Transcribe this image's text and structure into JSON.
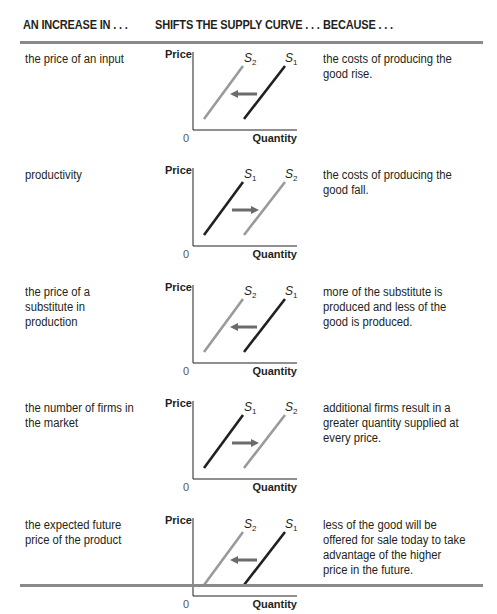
{
  "table": {
    "headers": [
      "AN INCREASE IN . . .",
      "SHIFTS THE SUPPLY CURVE . . .",
      "BECAUSE . . ."
    ],
    "axis_labels": {
      "y": "Price",
      "x": "Quantity",
      "origin": "0"
    },
    "colors": {
      "dark_curve": "#231f20",
      "light_curve": "#9a9a9a",
      "arrow": "#6b6b6b",
      "rule": "#8a8a8a"
    },
    "rows": [
      {
        "increase_in": "the price of an input",
        "direction": "left",
        "left_curve": {
          "label": "S",
          "sub": "2"
        },
        "right_curve": {
          "label": "S",
          "sub": "1"
        },
        "because": "the costs of producing the good rise."
      },
      {
        "increase_in": "productivity",
        "direction": "right",
        "left_curve": {
          "label": "S",
          "sub": "1"
        },
        "right_curve": {
          "label": "S",
          "sub": "2"
        },
        "because": "the costs of producing the good fall."
      },
      {
        "increase_in": "the price of a substitute in production",
        "direction": "left",
        "left_curve": {
          "label": "S",
          "sub": "2"
        },
        "right_curve": {
          "label": "S",
          "sub": "1"
        },
        "because": "more of the substitute is produced and less of the good is produced."
      },
      {
        "increase_in": "the number of firms in the market",
        "direction": "right",
        "left_curve": {
          "label": "S",
          "sub": "1"
        },
        "right_curve": {
          "label": "S",
          "sub": "2"
        },
        "because": "additional firms result in a greater quantity supplied at every price."
      },
      {
        "increase_in": "the expected future price of the product",
        "direction": "left",
        "left_curve": {
          "label": "S",
          "sub": "2"
        },
        "right_curve": {
          "label": "S",
          "sub": "1"
        },
        "because": "less of the good will be offered for sale today to take advantage of the higher price in the future."
      }
    ]
  }
}
